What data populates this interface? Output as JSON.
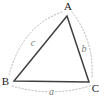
{
  "figure": {
    "type": "triangle-diagram",
    "vertices": [
      {
        "label": "A"
      },
      {
        "label": "B"
      },
      {
        "label": "C"
      }
    ],
    "sides": [
      {
        "label": "a",
        "opposite_vertex": "A"
      },
      {
        "label": "b",
        "opposite_vertex": "B"
      },
      {
        "label": "c",
        "opposite_vertex": "C"
      }
    ],
    "colors": {
      "edge": "#3f3f3f",
      "arc": "#b3b3b3",
      "vertex_label": "#1a1a1a",
      "side_label": "#7a7a7a",
      "background": "#ffffff"
    }
  }
}
